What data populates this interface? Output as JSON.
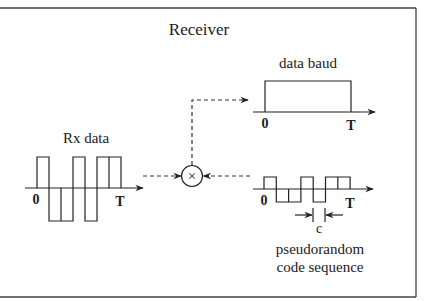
{
  "title": "Receiver",
  "colors": {
    "ink": "#222222",
    "background": "#ffffff"
  },
  "rx_signal": {
    "label": "Rx data",
    "start_label": "0",
    "end_label": "T",
    "bits": [
      1,
      -1,
      -1,
      1,
      -1,
      1,
      1
    ]
  },
  "multiplier": {
    "symbol": "×"
  },
  "output_signal": {
    "label": "data baud",
    "start_label": "0",
    "end_label": "T",
    "level": 1
  },
  "code_signal": {
    "label_line1": "pseudorandom",
    "label_line2": "code sequence",
    "start_label": "0",
    "end_label": "T",
    "chip_width_label": "c",
    "chips": [
      1,
      -1,
      -1,
      1,
      -1,
      1,
      1
    ]
  }
}
